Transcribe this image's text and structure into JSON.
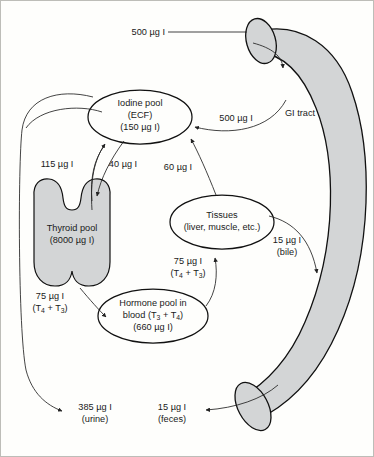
{
  "diagram": {
    "type": "flow-diagram",
    "units": "µg I",
    "background_color": "#fefefc",
    "organ_fill_color": "#d3d5d6",
    "outline_color": "#111111"
  },
  "nodes": {
    "iodine_pool": {
      "line1": "Iodine pool",
      "line2": "(ECF)",
      "line3": "(150 µg I)"
    },
    "thyroid_pool": {
      "line1": "Thyroid pool",
      "line2": "(8000 µg I)"
    },
    "tissues": {
      "line1": "Tissues",
      "line2": "(liver, muscle, etc.)"
    },
    "hormone_pool": {
      "line1": "Hormone pool in",
      "line2_pre": "blood (T",
      "line2_sub1": "3",
      "line2_mid": " + T",
      "line2_sub2": "4",
      "line2_post": ")",
      "line3": "(660 µg I)"
    },
    "gi_tract": {
      "label": "GI tract"
    }
  },
  "flows": {
    "intake": {
      "value": "500 µg I"
    },
    "gi_absorption": {
      "value": "500 µg I"
    },
    "thyroid_uptake": {
      "value": "115 µg I"
    },
    "thyroid_leak": {
      "value": "40 µg I"
    },
    "tissue_release": {
      "value": "60 µg I"
    },
    "thyroid_secretion": {
      "value": "75 µg I",
      "hormones_pre": "(T",
      "hormones_sub1": "4",
      "hormones_mid": " + T",
      "hormones_sub2": "3",
      "hormones_post": ")"
    },
    "tissue_uptake": {
      "value": "75 µg I",
      "hormones_pre": "(T",
      "hormones_sub1": "4",
      "hormones_mid": " + T",
      "hormones_sub2": "3",
      "hormones_post": ")"
    },
    "bile": {
      "value": "15 µg I",
      "route": "(bile)"
    },
    "feces": {
      "value": "15 µg I",
      "route": "(feces)"
    },
    "urine": {
      "value": "385 µg I",
      "route": "(urine)"
    }
  }
}
